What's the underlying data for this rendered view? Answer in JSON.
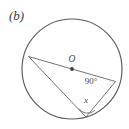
{
  "figure": {
    "part_label": "(b)",
    "background_color": "#ffffff",
    "stroke_color": "#5a5a5a",
    "text_color": "#4a4a4a"
  },
  "diagram": {
    "type": "circle-geometry",
    "circle": {
      "center_label": "O",
      "center_x": 72,
      "center_y": 69,
      "radius": 50
    },
    "points": {
      "center": {
        "label": "O",
        "x": 72,
        "y": 69
      },
      "diameter_left": {
        "x": 28.5,
        "y": 56.5
      },
      "diameter_right": {
        "x": 115.5,
        "y": 81.5
      },
      "vertex_bottom": {
        "x": 86,
        "y": 117
      }
    },
    "labels": {
      "center": "O",
      "right_angle": "90°",
      "unknown_angle": "x"
    },
    "label_positions": {
      "center": {
        "x": 72,
        "y": 61
      },
      "right_angle": {
        "x": 91,
        "y": 83
      },
      "unknown_angle": {
        "x": 86,
        "y": 101
      }
    },
    "segments": [
      {
        "name": "diameter",
        "from": "diameter_left",
        "to": "diameter_right"
      },
      {
        "name": "chord-left",
        "from": "diameter_left",
        "to": "vertex_bottom"
      },
      {
        "name": "chord-right",
        "from": "diameter_right",
        "to": "vertex_bottom"
      }
    ],
    "angle_arc": {
      "at": "vertex_bottom",
      "radius": 11,
      "label": "x"
    }
  }
}
